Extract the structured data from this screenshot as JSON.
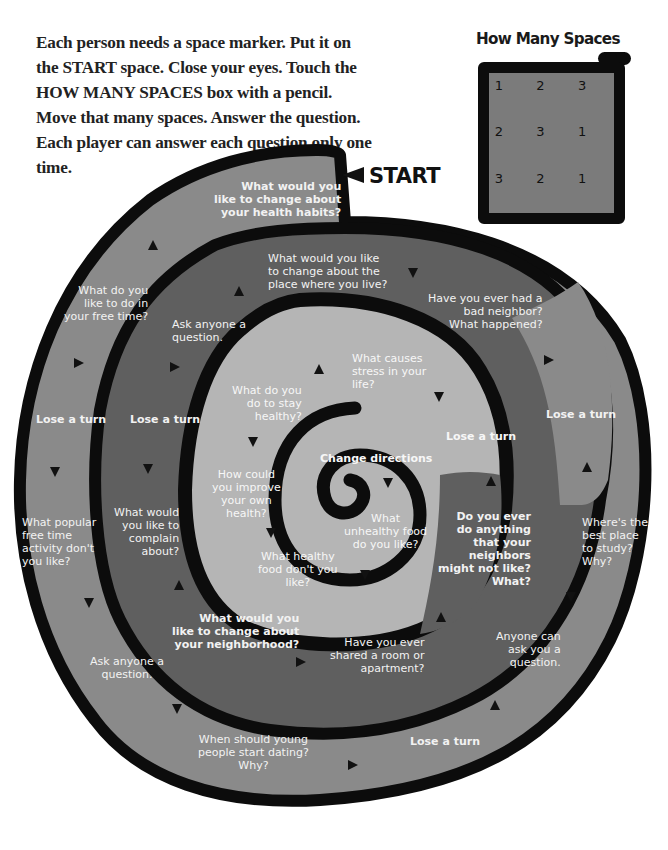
{
  "instructions": {
    "text": "Each person needs a space marker. Put it on the START space. Close your eyes. Touch the HOW MANY SPACES box with a pencil. Move that many spaces. Answer the question. Each player can answer each question only one time."
  },
  "how_many_spaces": {
    "title": "How Many Spaces",
    "grid": [
      "1",
      "2",
      "3",
      "2",
      "3",
      "1",
      "3",
      "2",
      "1"
    ],
    "box_color": "#7b7b7b"
  },
  "start": {
    "label": "START",
    "icon": "left-pointer-arrow"
  },
  "colors": {
    "outer_ring": "#8a8a8a",
    "middle_ring": "#5f5f5f",
    "inner_ring": "#b5b5b5",
    "border": "#0c0c0c",
    "text": "#f2f2f2"
  },
  "spaces": [
    {
      "id": "s1",
      "text": "What would you\nlike to change about\nyour health habits?",
      "bold": true
    },
    {
      "id": "s2",
      "text": "What do you\nlike to do in\nyour free time?"
    },
    {
      "id": "s3",
      "text": "Lose a turn",
      "bold": true
    },
    {
      "id": "s4",
      "text": "What popular\nfree time\nactivity don't\nyou like?"
    },
    {
      "id": "s5",
      "text": "Ask anyone a\nquestion."
    },
    {
      "id": "s6",
      "text": "When should young\npeople start dating?\nWhy?"
    },
    {
      "id": "s7",
      "text": "Lose a turn",
      "bold": true
    },
    {
      "id": "s8",
      "text": "Anyone can\nask you a\nquestion."
    },
    {
      "id": "s9",
      "text": "Where's the\nbest place\nto study?\nWhy?"
    },
    {
      "id": "s10",
      "text": "Lose a turn",
      "bold": true
    },
    {
      "id": "s11",
      "text": "Have you ever had a\nbad neighbor?\nWhat happened?"
    },
    {
      "id": "s12",
      "text": "What would you like\nto change about the\nplace where you live?"
    },
    {
      "id": "s13",
      "text": "Ask anyone a\nquestion."
    },
    {
      "id": "s14",
      "text": "Lose a turn",
      "bold": true
    },
    {
      "id": "s15",
      "text": "What would\nyou like to\ncomplain\nabout?"
    },
    {
      "id": "s16",
      "text": "What would you\nlike to change about\nyour neighborhood?",
      "bold": true
    },
    {
      "id": "s17",
      "text": "Have you ever\nshared a room or\napartment?"
    },
    {
      "id": "s18",
      "text": "Do you ever\ndo anything\nthat your\nneighbors\nmight not like?\nWhat?",
      "bold": true
    },
    {
      "id": "s19",
      "text": "Lose a turn",
      "bold": true
    },
    {
      "id": "s20",
      "text": "What causes\nstress in your\nlife?"
    },
    {
      "id": "s21",
      "text": "What do you\ndo to stay\nhealthy?"
    },
    {
      "id": "s22",
      "text": "How could\nyou improve\nyour own\nhealth?"
    },
    {
      "id": "s23",
      "text": "What healthy\nfood don't you\nlike?"
    },
    {
      "id": "s24",
      "text": "What\nunhealthy food\ndo you like?"
    },
    {
      "id": "s25",
      "text": "Change directions",
      "bold": true
    }
  ]
}
